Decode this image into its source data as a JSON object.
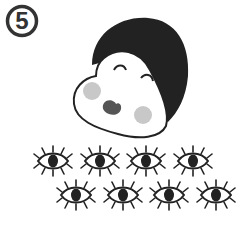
{
  "badge": {
    "number": "5"
  },
  "illustration": {
    "subject": "otafuku-face",
    "eye_rows": [
      {
        "count": 4
      },
      {
        "count": 4
      }
    ]
  },
  "colors": {
    "ink": "#222222",
    "cheek": "#c8c8c8",
    "mouth": "#555555",
    "background": "#ffffff"
  }
}
